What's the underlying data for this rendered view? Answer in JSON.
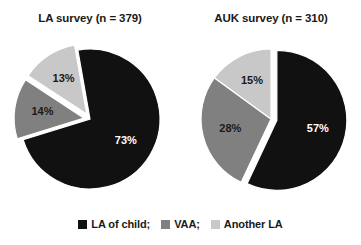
{
  "chart_data": [
    {
      "type": "pie",
      "title": "LA survey (n = 379)",
      "panel": "left",
      "categories": [
        "LA of child;",
        "VAA;",
        "Another LA"
      ],
      "values": [
        73,
        14,
        13
      ],
      "labels": [
        "73%",
        "14%",
        "13%"
      ],
      "colors": [
        "#111111",
        "#808080",
        "#c8c8c8"
      ],
      "start_angle": -10,
      "exploded": [
        false,
        true,
        true
      ],
      "legend_position": "bottom"
    },
    {
      "type": "pie",
      "title": "AUK survey (n = 310)",
      "panel": "right",
      "categories": [
        "LA of child;",
        "VAA;",
        "Another LA"
      ],
      "values": [
        57,
        28,
        15
      ],
      "labels": [
        "57%",
        "28%",
        "15%"
      ],
      "colors": [
        "#111111",
        "#808080",
        "#c8c8c8"
      ],
      "start_angle": 0,
      "exploded": [
        true,
        false,
        false
      ],
      "legend_position": "bottom"
    }
  ],
  "panels": [
    {
      "title": "LA survey (n = 379)"
    },
    {
      "title": "AUK survey (n = 310)"
    }
  ],
  "legend": {
    "items": [
      {
        "label": "LA of child;",
        "color": "#111111"
      },
      {
        "label": "VAA;",
        "color": "#808080"
      },
      {
        "label": "Another LA",
        "color": "#c8c8c8"
      }
    ]
  },
  "colors": {
    "series_dark": "#111111",
    "series_mid": "#808080",
    "series_light": "#c8c8c8",
    "background": "#ffffff",
    "text": "#1a1a1a"
  }
}
